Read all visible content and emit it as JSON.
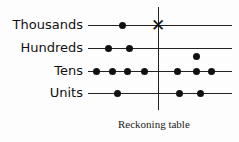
{
  "diagram": {
    "caption": "Reckoning table",
    "rows": [
      {
        "label": "Thousands",
        "y": 25,
        "left_dots_x": [
          122
        ],
        "right_dots_x": [],
        "marker": "X at divider"
      },
      {
        "label": "Hundreds",
        "y": 48,
        "left_dots_x": [
          108,
          129
        ],
        "right_dots_x": []
      },
      {
        "label": "Tens",
        "y": 71,
        "left_dots_x": [
          96,
          112,
          127,
          144
        ],
        "right_dots_x": [
          177,
          196,
          211
        ],
        "extra_dot": {
          "x": 196,
          "y": 56
        }
      },
      {
        "label": "Units",
        "y": 93,
        "left_dots_x": [
          117
        ],
        "right_dots_x": [
          179,
          200
        ]
      }
    ],
    "cross_symbol": "✕"
  }
}
